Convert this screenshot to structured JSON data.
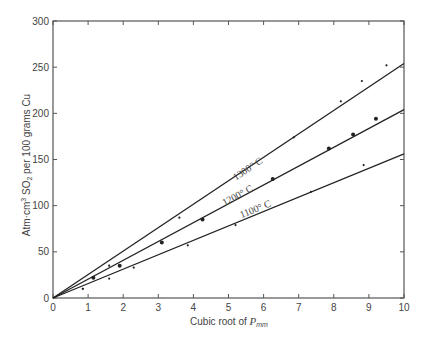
{
  "chart_data": {
    "type": "scatter",
    "title": "",
    "xlabel": "Cubic root of P_mm",
    "xlabel_main": "Cubic root of ",
    "xlabel_var": "P",
    "xlabel_sub": "mm",
    "ylabel": "Atm·cm³ SO₂ per 100 grams Cu",
    "ylabel_parts": {
      "a": "Atm·cm",
      "sup": "3",
      "b": " SO",
      "sub": "2",
      "c": " per 100 grams Cu"
    },
    "xlim": [
      0,
      10
    ],
    "ylim": [
      0,
      300
    ],
    "xticks": [
      0,
      1,
      2,
      3,
      4,
      5,
      6,
      7,
      8,
      9,
      10
    ],
    "yticks": [
      0,
      50,
      100,
      150,
      200,
      250,
      300
    ],
    "grid": false,
    "legend": "inline line labels",
    "series": [
      {
        "name": "1300° C",
        "fit_line": [
          [
            0,
            0
          ],
          [
            10,
            254
          ]
        ],
        "marker": "small",
        "points": [
          [
            0.85,
            10
          ],
          [
            1.6,
            35
          ],
          [
            3.6,
            87
          ],
          [
            6.86,
            174
          ],
          [
            8.2,
            213
          ],
          [
            8.8,
            235
          ],
          [
            9.5,
            252
          ]
        ]
      },
      {
        "name": "1200° C",
        "fit_line": [
          [
            0,
            0
          ],
          [
            10,
            204
          ]
        ],
        "marker": "filled",
        "points": [
          [
            1.15,
            22
          ],
          [
            1.9,
            35
          ],
          [
            3.1,
            60
          ],
          [
            4.26,
            85
          ],
          [
            6.26,
            129
          ],
          [
            7.86,
            162
          ],
          [
            8.55,
            177
          ],
          [
            9.2,
            194
          ]
        ]
      },
      {
        "name": "1100° C",
        "fit_line": [
          [
            0,
            0
          ],
          [
            10,
            156
          ]
        ],
        "marker": "small",
        "points": [
          [
            0.85,
            10
          ],
          [
            1.6,
            21
          ],
          [
            2.3,
            33
          ],
          [
            3.84,
            57
          ],
          [
            5.2,
            79
          ],
          [
            7.35,
            115
          ],
          [
            8.85,
            144
          ]
        ]
      }
    ],
    "annotations": [
      {
        "text": "1300° C",
        "x": 5.6,
        "y": 137
      },
      {
        "text": "1200° C",
        "x": 5.3,
        "y": 108
      },
      {
        "text": "1100° C",
        "x": 5.8,
        "y": 93
      }
    ]
  }
}
